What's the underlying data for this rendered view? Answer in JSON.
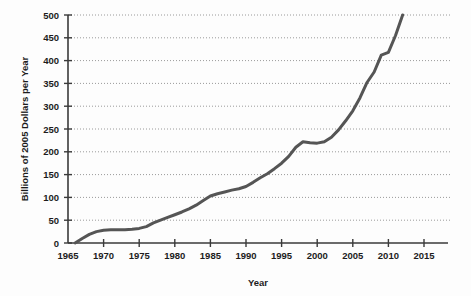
{
  "chart_data": {
    "type": "line",
    "title": "",
    "xlabel": "Year",
    "ylabel": "Billions of 2005 Dollars per Year",
    "xlim": [
      1965,
      2015
    ],
    "ylim": [
      0,
      500
    ],
    "xticks": [
      1965,
      1970,
      1975,
      1980,
      1985,
      1990,
      1995,
      2000,
      2005,
      2010,
      2015
    ],
    "yticks": [
      0,
      50,
      100,
      150,
      200,
      250,
      300,
      350,
      400,
      450,
      500
    ],
    "grid": true,
    "grid_style": "dotted-horizontal",
    "legend": "none",
    "line_color": "#555555",
    "line_width": 3,
    "background_color": "#fdfdfd",
    "axis_color": "#3a3a3a",
    "series": [
      {
        "name": "Value",
        "x": [
          1966,
          1967,
          1968,
          1969,
          1970,
          1971,
          1972,
          1973,
          1974,
          1975,
          1976,
          1977,
          1978,
          1979,
          1980,
          1981,
          1982,
          1983,
          1984,
          1985,
          1986,
          1987,
          1988,
          1989,
          1990,
          1991,
          1992,
          1993,
          1994,
          1995,
          1996,
          1997,
          1998,
          1999,
          2000,
          2001,
          2002,
          2003,
          2004,
          2005,
          2006,
          2007,
          2008,
          2009,
          2010,
          2011,
          2012
        ],
        "values": [
          0,
          10,
          19,
          25,
          28,
          29,
          29,
          29,
          30,
          32,
          36,
          44,
          50,
          56,
          62,
          68,
          75,
          83,
          93,
          103,
          108,
          112,
          116,
          119,
          124,
          133,
          143,
          152,
          163,
          175,
          190,
          210,
          222,
          220,
          219,
          222,
          232,
          248,
          268,
          290,
          318,
          352,
          375,
          412,
          418,
          455,
          500
        ]
      }
    ]
  },
  "axis": {
    "x_tick_labels": [
      "1965",
      "1970",
      "1975",
      "1980",
      "1985",
      "1990",
      "1995",
      "2000",
      "2005",
      "2010",
      "2015"
    ],
    "y_tick_labels": [
      "0",
      "50",
      "100",
      "150",
      "200",
      "250",
      "300",
      "350",
      "400",
      "450",
      "500"
    ],
    "x_title": "Year",
    "y_title": "Billions of 2005 Dollars per Year"
  }
}
